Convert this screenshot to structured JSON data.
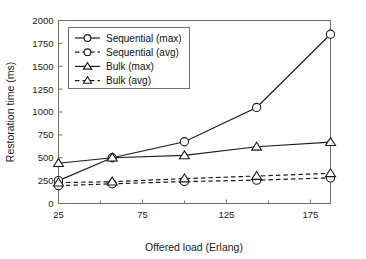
{
  "chart_data": {
    "type": "line",
    "title": "",
    "xlabel": "Offered load (Erlang)",
    "ylabel": "Restoration time (ms)",
    "xlim": [
      25,
      187
    ],
    "ylim": [
      0,
      2000
    ],
    "xticks": [
      25,
      75,
      125,
      175
    ],
    "xtick_labels": [
      "25",
      "75",
      "125",
      "175"
    ],
    "xminor_ticks": [
      50,
      100,
      150
    ],
    "yticks": [
      0,
      250,
      500,
      750,
      1000,
      1250,
      1500,
      1750,
      2000
    ],
    "ytick_labels": [
      "0",
      "250",
      "500",
      "750",
      "1000",
      "1250",
      "1500",
      "1750",
      "2000"
    ],
    "grid": false,
    "legend_position": "upper-left-inside",
    "x": [
      25,
      57,
      100,
      143,
      187
    ],
    "series": [
      {
        "name": "Sequential (max)",
        "values": [
          250,
          500,
          675,
          1050,
          1850
        ],
        "style": "solid",
        "marker": "circle"
      },
      {
        "name": "Sequential (avg)",
        "values": [
          195,
          215,
          240,
          255,
          280
        ],
        "style": "dashed",
        "marker": "circle"
      },
      {
        "name": "Bulk (max)",
        "values": [
          440,
          500,
          525,
          620,
          670
        ],
        "style": "solid",
        "marker": "triangle"
      },
      {
        "name": "Bulk (avg)",
        "values": [
          228,
          238,
          272,
          300,
          330
        ],
        "style": "dashed",
        "marker": "triangle"
      }
    ],
    "legend": [
      {
        "label": "Sequential (max)",
        "style": "solid",
        "marker": "circle"
      },
      {
        "label": "Sequential (avg)",
        "style": "dashed",
        "marker": "circle"
      },
      {
        "label": "Bulk (max)",
        "style": "solid",
        "marker": "triangle"
      },
      {
        "label": "Bulk (avg)",
        "style": "dashed",
        "marker": "triangle"
      }
    ],
    "colors": {
      "line": "#1b1b1b",
      "axis": "#6f6f6f",
      "text": "#222222",
      "background": "#ffffff"
    }
  }
}
